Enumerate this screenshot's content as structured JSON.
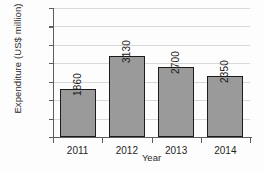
{
  "chart_data": {
    "type": "bar",
    "title": "",
    "xlabel": "Year",
    "ylabel": "Expenditure (US$ million)",
    "categories": [
      "2011",
      "2012",
      "2013",
      "2014"
    ],
    "values": [
      1.3,
      2.21,
      1.9,
      1.66
    ],
    "data_labels": [
      "1860",
      "3130",
      "2700",
      "2350"
    ],
    "ylim": [
      0,
      3.5
    ],
    "ytick_labels": [
      "0",
      "0.5",
      "1",
      "1.5",
      "2",
      "2.5",
      "3",
      "3.5"
    ],
    "ytick_values": [
      0,
      0.5,
      1,
      1.5,
      2,
      2.5,
      3,
      3.5
    ],
    "grid": true,
    "legend": "none",
    "bar_fill_color": "#9a9a9a",
    "bar_edge_color": "#1c1c1c",
    "gridline_color": "#d8d8d8",
    "axis_color": "#5d5d5d"
  }
}
